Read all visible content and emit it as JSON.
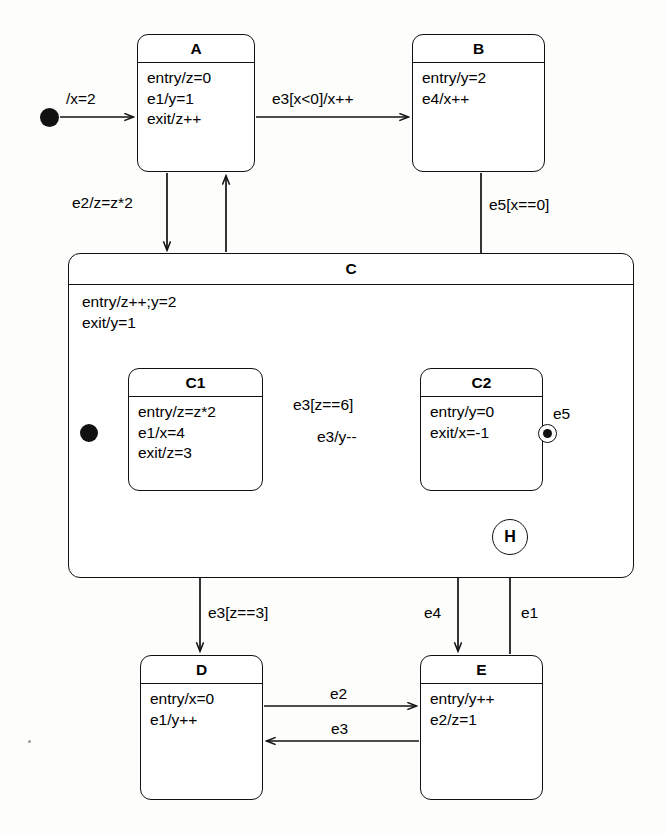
{
  "diagram": {
    "kind": "uml-state-machine-diagram",
    "states": [
      {
        "id": "A",
        "name": "A",
        "lines": [
          "entry/z=0",
          "e1/y=1",
          "exit/z++"
        ]
      },
      {
        "id": "B",
        "name": "B",
        "lines": [
          "entry/y=2",
          "e4/x++"
        ]
      },
      {
        "id": "C",
        "name": "C",
        "lines": [
          "entry/z++;y=2",
          "exit/y=1"
        ],
        "composite": true
      },
      {
        "id": "C1",
        "name": "C1",
        "lines": [
          "entry/z=z*2",
          "e1/x=4",
          "exit/z=3"
        ]
      },
      {
        "id": "C2",
        "name": "C2",
        "lines": [
          "entry/y=0",
          "exit/x=-1"
        ]
      },
      {
        "id": "D",
        "name": "D",
        "lines": [
          "entry/x=0",
          "e1/y++"
        ]
      },
      {
        "id": "E",
        "name": "E",
        "lines": [
          "entry/y++",
          "e2/z=1"
        ]
      }
    ],
    "pseudostates": [
      {
        "id": "init-top",
        "kind": "initial",
        "label": ""
      },
      {
        "id": "init-c",
        "kind": "initial",
        "label": ""
      },
      {
        "id": "final-c",
        "kind": "final",
        "label": ""
      },
      {
        "id": "history-c",
        "kind": "shallow-history",
        "label": "H"
      }
    ],
    "transitions": [
      {
        "id": "t1",
        "from": "init-top",
        "to": "A",
        "label": "/x=2"
      },
      {
        "id": "t2",
        "from": "A",
        "to": "B",
        "label": "e3[x<0]/x++"
      },
      {
        "id": "t3",
        "from": "A",
        "to": "C",
        "label": "e2/z=z*2"
      },
      {
        "id": "t4",
        "from": "C",
        "to": "A",
        "label": ""
      },
      {
        "id": "t5",
        "from": "B",
        "to": "C2",
        "label": "e5[x==0]"
      },
      {
        "id": "t6",
        "from": "init-c",
        "to": "C1",
        "label": ""
      },
      {
        "id": "t7",
        "from": "C1",
        "to": "C2",
        "label": "e3[z==6]"
      },
      {
        "id": "t8",
        "from": "C2",
        "to": "C1",
        "label": "e3/y--"
      },
      {
        "id": "t9",
        "from": "C2",
        "to": "final-c",
        "label": "e5"
      },
      {
        "id": "t10",
        "from": "C1",
        "to": "D",
        "label": "e3[z==3]"
      },
      {
        "id": "t11",
        "from": "C2",
        "to": "E",
        "label": "e4"
      },
      {
        "id": "t12",
        "from": "E",
        "to": "history-c",
        "label": "e1"
      },
      {
        "id": "t13",
        "from": "history-c",
        "to": "C",
        "label": ""
      },
      {
        "id": "t14",
        "from": "D",
        "to": "E",
        "label": "e2"
      },
      {
        "id": "t15",
        "from": "E",
        "to": "D",
        "label": "e3"
      }
    ],
    "labels": {
      "init_top": "/x=2",
      "a_to_b": "e3[x<0]/x++",
      "a_to_c": "e2/z=z*2",
      "b_to_c2": "e5[x==0]",
      "c1_to_c2": "e3[z==6]",
      "c2_to_c1": "e3/y--",
      "c2_to_final": "e5",
      "c1_to_d": "e3[z==3]",
      "c2_to_e": "e4",
      "e_to_h": "e1",
      "d_to_e": "e2",
      "e_to_d": "e3",
      "history_glyph": "H"
    },
    "colors": {
      "stroke": "#111111",
      "fill": "#ffffff",
      "background": "#fdfdfc"
    }
  }
}
